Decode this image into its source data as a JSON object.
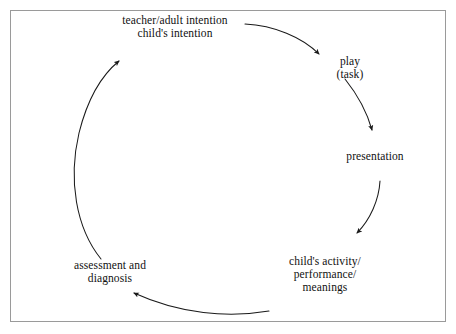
{
  "figure": {
    "type": "cycle-diagram",
    "orientation": "clockwise",
    "border_color": "#9a9a9a",
    "stroke_color": "#1a1a1a",
    "background": "#ffffff",
    "nodes": [
      {
        "id": "intention",
        "lines": [
          "teacher/adult intention",
          "child's intention"
        ],
        "position": "top"
      },
      {
        "id": "play",
        "lines": [
          "play",
          "(task)"
        ],
        "position": "top-right"
      },
      {
        "id": "presentation",
        "lines": [
          "presentation"
        ],
        "position": "right"
      },
      {
        "id": "child-activity",
        "lines": [
          "child's activity/",
          "performance/",
          "meanings"
        ],
        "position": "bottom-right"
      },
      {
        "id": "assessment",
        "lines": [
          "assessment and",
          "diagnosis"
        ],
        "position": "bottom-left"
      }
    ],
    "arrows": [
      {
        "id": "intention-to-play",
        "from": "intention",
        "to": "play"
      },
      {
        "id": "play-to-presentation",
        "from": "play",
        "to": "presentation"
      },
      {
        "id": "presentation-to-child-activity",
        "from": "presentation",
        "to": "child-activity"
      },
      {
        "id": "child-activity-to-assessment",
        "from": "child-activity",
        "to": "assessment"
      },
      {
        "id": "assessment-to-intention",
        "from": "assessment",
        "to": "intention"
      }
    ]
  }
}
